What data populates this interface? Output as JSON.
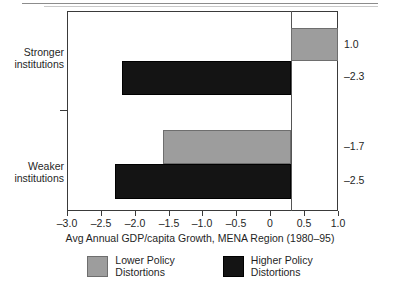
{
  "chart_data": {
    "type": "bar",
    "orientation": "horizontal",
    "title": "",
    "xlabel": "Avg  Annual GDP/capita Growth, MENA Region (1980–95)",
    "ylabel": "",
    "categories": [
      "Stronger institutions",
      "Weaker institutions"
    ],
    "category_labels": [
      {
        "line1": "Stronger",
        "line2": "institutions"
      },
      {
        "line1": "Weaker",
        "line2": "institutions"
      }
    ],
    "series": [
      {
        "name": "Lower Policy Distortions",
        "color": "#9d9d9d",
        "values": [
          1.0,
          -1.7
        ]
      },
      {
        "name": "Higher Policy Distortions",
        "color": "#141414",
        "values": [
          -2.3,
          -2.5
        ]
      }
    ],
    "bars": [
      {
        "category": "Stronger institutions",
        "series": "Lower Policy Distortions",
        "value": 1.0,
        "label": "1.0",
        "left": 291,
        "top": 28,
        "width": 47,
        "height": 33,
        "style": "gray"
      },
      {
        "category": "Stronger institutions",
        "series": "Higher Policy Distortions",
        "value": -2.3,
        "label": "–2.3",
        "left": 122,
        "top": 61,
        "width": 169,
        "height": 34,
        "style": "black"
      },
      {
        "category": "Weaker institutions",
        "series": "Lower Policy Distortions",
        "value": -1.7,
        "label": "–1.7",
        "left": 163,
        "top": 130,
        "width": 128,
        "height": 34,
        "style": "gray"
      },
      {
        "category": "Weaker institutions",
        "series": "Higher Policy Distortions",
        "value": -2.5,
        "label": "–2.5",
        "left": 115,
        "top": 164,
        "width": 176,
        "height": 35,
        "style": "black"
      }
    ],
    "value_labels": [
      {
        "text": "1.0",
        "top": 38
      },
      {
        "text": "–2.3",
        "top": 70
      },
      {
        "text": "–1.7",
        "top": 140
      },
      {
        "text": "–2.5",
        "top": 174
      }
    ],
    "xlim": [
      -3.0,
      1.0
    ],
    "xticks": [
      -3.0,
      -2.5,
      -2.0,
      -1.5,
      -1.0,
      -0.5,
      0,
      0.5,
      1.0
    ],
    "xtick_labels": [
      "–3.0",
      "–2.5",
      "–2.0",
      "–1.5",
      "–1.0",
      "–0.5",
      "0",
      "0.5",
      "1.0"
    ],
    "xtick_positions": [
      67,
      101,
      135,
      169,
      202,
      236,
      270,
      304,
      338
    ],
    "grid": false,
    "legend_position": "bottom",
    "legend": [
      {
        "label_line1": "Lower Policy",
        "label_line2": "Distortions",
        "swatch": "gray"
      },
      {
        "label_line1": "Higher Policy",
        "label_line2": "Distortions",
        "swatch": "black"
      }
    ]
  }
}
